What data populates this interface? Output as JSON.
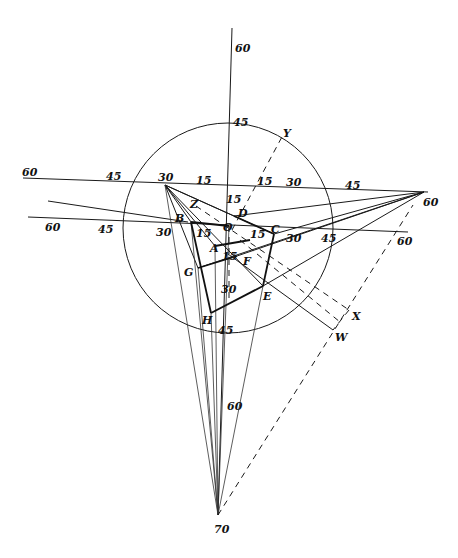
{
  "diagram": {
    "type": "perspective-construction",
    "circle": {
      "cx": 228,
      "cy": 228,
      "r": 105
    },
    "scale_labels": {
      "vertical_top_60": "60",
      "vertical_top_45": "45",
      "vertical_15": "15",
      "vertical_30": "30",
      "vertical_45": "45",
      "vertical_60": "60",
      "vertical_bottom_70": "70",
      "upper_left_60": "60",
      "upper_left_45": "45",
      "upper_left_30": "30",
      "upper_left_15": "15",
      "upper_right_15": "15",
      "upper_right_30": "30",
      "upper_right_45": "45",
      "upper_right_60": "60",
      "lower_left_60": "60",
      "lower_left_45": "45",
      "lower_left_30": "30",
      "inner_15_left": "15",
      "inner_15_right": "15",
      "inner_15_center": "15",
      "lower_right_30": "30",
      "lower_right_45": "45",
      "lower_right_60": "60"
    },
    "points": {
      "A": "A",
      "B": "B",
      "C": "C",
      "D": "D",
      "E": "E",
      "F": "F",
      "G": "G",
      "H": "H",
      "O": "O",
      "W": "W",
      "X": "X",
      "Y": "Y",
      "Z": "Z"
    }
  }
}
